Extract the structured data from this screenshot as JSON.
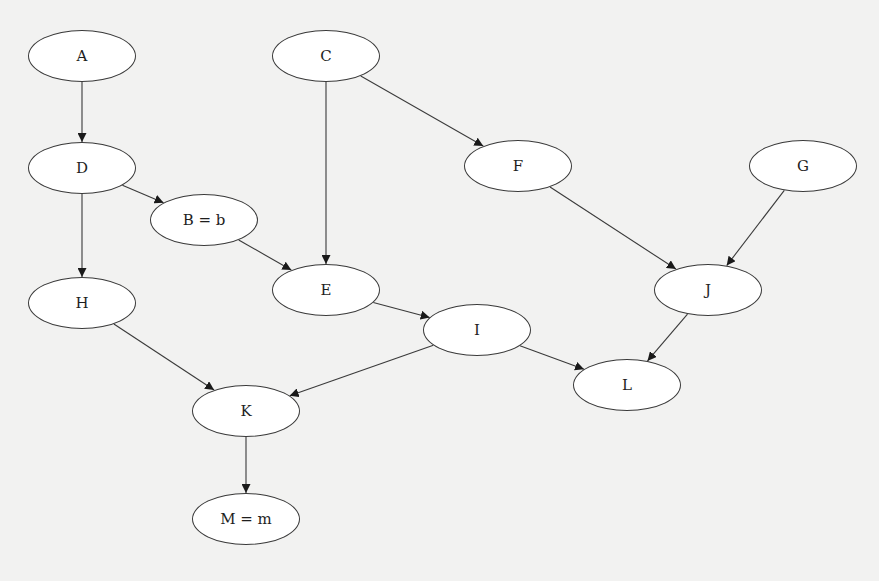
{
  "diagram": {
    "type": "directed-graph",
    "background": "#f2f2f1",
    "node_fill": "#ffffff",
    "stroke": "#3a3a3a",
    "nodes": [
      {
        "id": "A",
        "label": "A",
        "x": 82,
        "y": 56
      },
      {
        "id": "C",
        "label": "C",
        "x": 326,
        "y": 56
      },
      {
        "id": "D",
        "label": "D",
        "x": 82,
        "y": 168
      },
      {
        "id": "B",
        "label": "B = b",
        "x": 204,
        "y": 220
      },
      {
        "id": "F",
        "label": "F",
        "x": 518,
        "y": 166
      },
      {
        "id": "G",
        "label": "G",
        "x": 803,
        "y": 166
      },
      {
        "id": "E",
        "label": "E",
        "x": 326,
        "y": 290
      },
      {
        "id": "H",
        "label": "H",
        "x": 82,
        "y": 303
      },
      {
        "id": "J",
        "label": "J",
        "x": 708,
        "y": 290
      },
      {
        "id": "I",
        "label": "I",
        "x": 477,
        "y": 330
      },
      {
        "id": "L",
        "label": "L",
        "x": 627,
        "y": 385
      },
      {
        "id": "K",
        "label": "K",
        "x": 246,
        "y": 411
      },
      {
        "id": "M",
        "label": "M = m",
        "x": 246,
        "y": 519
      }
    ],
    "edges": [
      {
        "from": "A",
        "to": "D"
      },
      {
        "from": "D",
        "to": "B"
      },
      {
        "from": "D",
        "to": "H"
      },
      {
        "from": "C",
        "to": "E"
      },
      {
        "from": "C",
        "to": "F"
      },
      {
        "from": "B",
        "to": "E"
      },
      {
        "from": "E",
        "to": "I"
      },
      {
        "from": "F",
        "to": "J"
      },
      {
        "from": "G",
        "to": "J"
      },
      {
        "from": "J",
        "to": "L"
      },
      {
        "from": "I",
        "to": "L"
      },
      {
        "from": "I",
        "to": "K"
      },
      {
        "from": "H",
        "to": "K"
      },
      {
        "from": "K",
        "to": "M"
      }
    ]
  }
}
